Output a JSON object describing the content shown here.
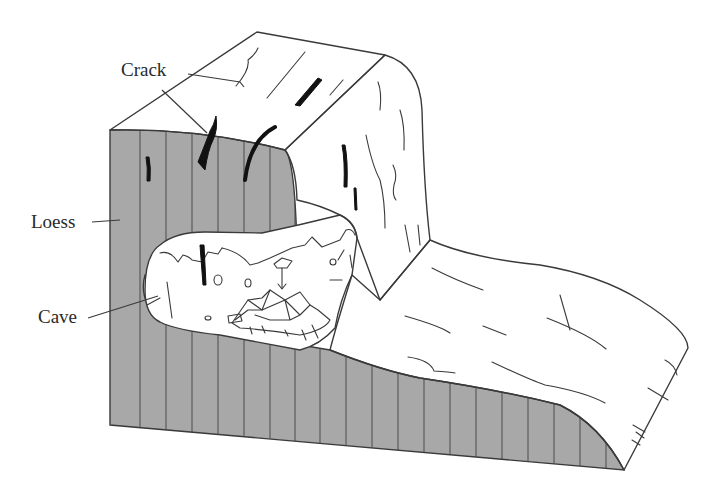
{
  "figure": {
    "type": "geological cross-section block diagram",
    "colors": {
      "loess_fill": "#a8a8a8",
      "surface_fill": "#ffffff",
      "line": "#3a3a3a",
      "crack": "#111111"
    },
    "labels": [
      {
        "id": "crack",
        "text": "Crack"
      },
      {
        "id": "loess",
        "text": "Loess"
      },
      {
        "id": "cave",
        "text": "Cave"
      }
    ]
  }
}
